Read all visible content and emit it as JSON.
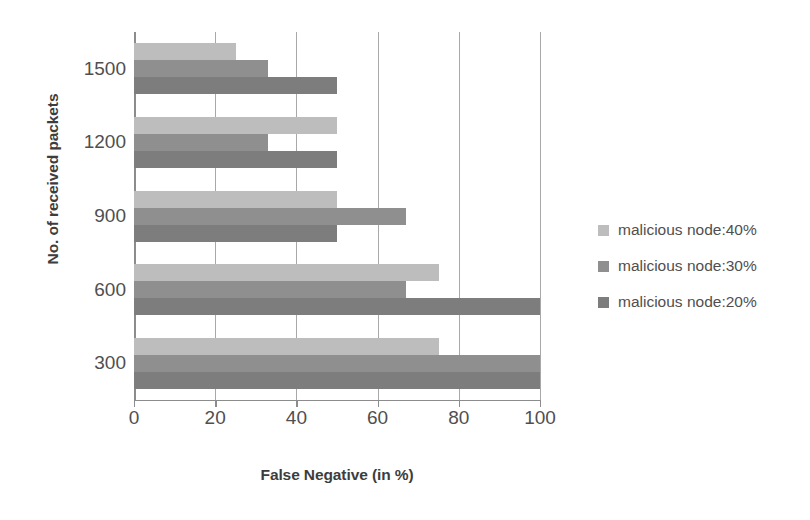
{
  "chart_data": {
    "type": "bar",
    "orientation": "horizontal",
    "title": "",
    "xlabel": "False Negative (in %)",
    "ylabel": "No. of received packets",
    "categories": [
      "1500",
      "1200",
      "900",
      "600",
      "300"
    ],
    "series": [
      {
        "name": "malicious node:40%",
        "color": "#bdbdbd",
        "values": [
          25,
          50,
          50,
          75,
          75
        ]
      },
      {
        "name": "malicious node:30%",
        "color": "#8f8f8f",
        "values": [
          33,
          33,
          67,
          67,
          100
        ]
      },
      {
        "name": "malicious node:20%",
        "color": "#7d7d7d",
        "values": [
          50,
          50,
          50,
          100,
          100
        ]
      }
    ],
    "xlim": [
      0,
      100
    ],
    "xticks": [
      0,
      20,
      40,
      60,
      80,
      100
    ],
    "xtick_labels": [
      "0",
      "20",
      "40",
      "60",
      "80",
      "100"
    ],
    "grid": "vertical",
    "legend_position": "right"
  },
  "legend": {
    "items": [
      {
        "label": "malicious node:40%",
        "color": "#bdbdbd"
      },
      {
        "label": "malicious node:30%",
        "color": "#8f8f8f"
      },
      {
        "label": "malicious node:20%",
        "color": "#7d7d7d"
      }
    ]
  }
}
